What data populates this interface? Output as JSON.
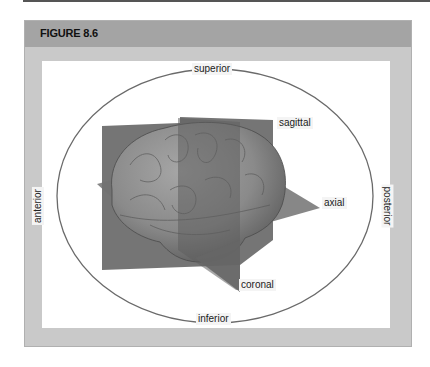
{
  "figure": {
    "title": "FIGURE 8.6"
  },
  "diagram": {
    "direction_labels": {
      "top": "superior",
      "bottom": "inferior",
      "left": "anterior",
      "right": "posterior"
    },
    "plane_labels": {
      "sagittal": "sagittal",
      "axial": "axial",
      "coronal": "coronal"
    },
    "colors": {
      "frame": "#c9c9c9",
      "header": "#a4a4a4",
      "plane": "#6e6e6e",
      "brain": "#8c8c8c",
      "ellipse": "#555555"
    }
  }
}
